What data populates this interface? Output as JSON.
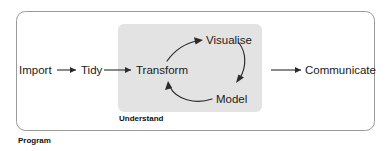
{
  "diagram": {
    "type": "flow-diagram",
    "outer_group": {
      "label": "Program",
      "border_color": "#9a9a9a",
      "fill_color": "#ffffff"
    },
    "inner_group": {
      "label": "Understand",
      "fill_color": "#e3e3e3"
    },
    "nodes": {
      "import": "Import",
      "tidy": "Tidy",
      "transform": "Transform",
      "visualise": "Visualise",
      "model": "Model",
      "communicate": "Communicate"
    },
    "edges": [
      {
        "from": "Import",
        "to": "Tidy",
        "style": "straight"
      },
      {
        "from": "Tidy",
        "to": "Transform",
        "style": "straight"
      },
      {
        "from": "Transform",
        "to": "Visualise",
        "style": "curved"
      },
      {
        "from": "Visualise",
        "to": "Model",
        "style": "curved"
      },
      {
        "from": "Model",
        "to": "Transform",
        "style": "curved"
      },
      {
        "from": "Transform",
        "to": "Communicate",
        "style": "straight"
      }
    ],
    "colors": {
      "line": "#2b2b2b",
      "text": "#1a1a1a",
      "panel_gray": "#e3e3e3",
      "border_gray": "#9a9a9a"
    }
  }
}
